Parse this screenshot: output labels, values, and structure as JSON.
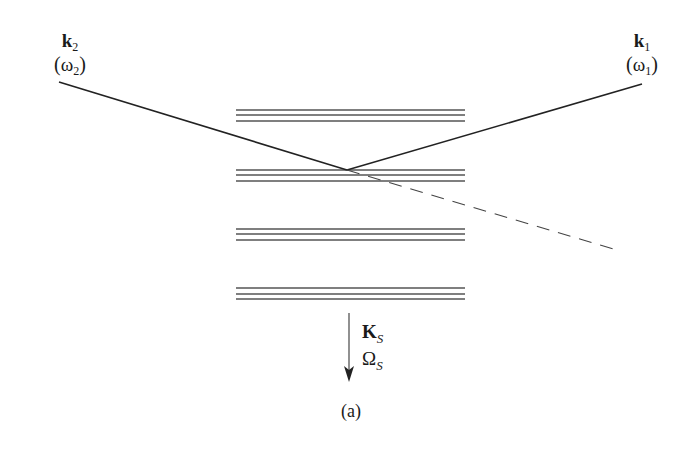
{
  "figure": {
    "caption": "(a)",
    "colors": {
      "line": "#222222",
      "layer": "#555555",
      "background": "#ffffff"
    }
  },
  "labels": {
    "wave2": {
      "vector": "k",
      "subscript": "2",
      "freq_symbol": "ω",
      "freq_subscript": "2",
      "open": "(",
      "close": ")"
    },
    "wave1": {
      "vector": "k",
      "subscript": "1",
      "freq_symbol": "ω",
      "freq_subscript": "1",
      "open": "(",
      "close": ")"
    },
    "scatter": {
      "vector": "K",
      "subscript": "S",
      "freq_symbol": "Ω",
      "freq_subscript": "S"
    }
  },
  "diagram": {
    "incident_left_line": {
      "x1": 59,
      "y1": 82,
      "x2": 347,
      "y2": 170
    },
    "incident_right_line": {
      "x1": 347,
      "y1": 170,
      "x2": 642,
      "y2": 84
    },
    "dashed_continuation": {
      "x1": 347,
      "y1": 170,
      "x2": 617,
      "y2": 250
    },
    "layer_x_start": 236,
    "layer_x_end": 465,
    "layers": [
      {
        "lines_y": [
          110,
          115,
          121
        ]
      },
      {
        "lines_y": [
          170,
          175,
          181
        ]
      },
      {
        "lines_y": [
          229,
          234,
          240
        ]
      },
      {
        "lines_y": [
          288,
          294,
          299
        ]
      }
    ],
    "arrow": {
      "x": 349,
      "y1": 313,
      "y2": 382
    }
  }
}
